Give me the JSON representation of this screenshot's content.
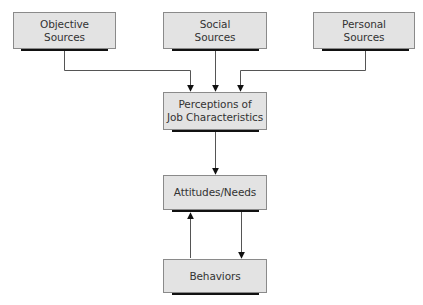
{
  "diagram": {
    "type": "flowchart",
    "nodes": [
      {
        "id": "objective",
        "label": "Objective\nSources"
      },
      {
        "id": "social",
        "label": "Social\nSources"
      },
      {
        "id": "personal",
        "label": "Personal\nSources"
      },
      {
        "id": "perceptions",
        "label": "Perceptions of\nJob Characteristics"
      },
      {
        "id": "attitudes",
        "label": "Attitudes/Needs"
      },
      {
        "id": "behaviors",
        "label": "Behaviors"
      }
    ],
    "edges": [
      {
        "from": "objective",
        "to": "perceptions"
      },
      {
        "from": "social",
        "to": "perceptions"
      },
      {
        "from": "personal",
        "to": "perceptions"
      },
      {
        "from": "perceptions",
        "to": "attitudes"
      },
      {
        "from": "attitudes",
        "to": "behaviors"
      },
      {
        "from": "behaviors",
        "to": "attitudes"
      }
    ],
    "colors": {
      "box_fill": "#e3e3e3",
      "box_border": "#8a8a8a",
      "shadow": "#111111",
      "line": "#555555",
      "text": "#333333"
    }
  }
}
